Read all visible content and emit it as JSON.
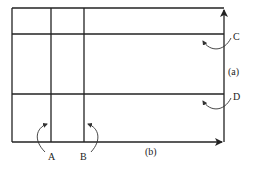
{
  "diagram": {
    "labels": {
      "A": "A",
      "B": "B",
      "C": "C",
      "D": "D",
      "a": "(a)",
      "b": "(b)"
    },
    "colors": {
      "line": "#222222",
      "background": "#ffffff"
    }
  }
}
